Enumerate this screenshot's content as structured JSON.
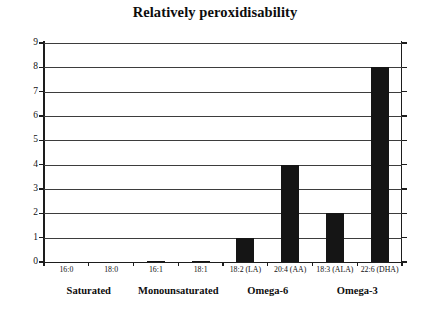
{
  "chart_data": {
    "type": "bar",
    "title": "Relatively peroxidisability",
    "xlabel": "",
    "ylabel": "",
    "ylim": [
      0,
      9
    ],
    "yticks": [
      0,
      1,
      2,
      3,
      4,
      5,
      6,
      7,
      8,
      9
    ],
    "grid": true,
    "legend": false,
    "categories": [
      "16:0",
      "18:0",
      "16:1",
      "18:1",
      "18:2 (LA)",
      "20:4 (AA)",
      "18:3 (ALA)",
      "22:6 (DHA)"
    ],
    "values": [
      0,
      0,
      0.025,
      0.025,
      1,
      4,
      2,
      8
    ],
    "groups": [
      {
        "label": "Saturated",
        "categories": [
          "16:0",
          "18:0"
        ]
      },
      {
        "label": "Monounsaturated",
        "categories": [
          "16:1",
          "18:1"
        ]
      },
      {
        "label": "Omega-6",
        "categories": [
          "18:2 (LA)",
          "20:4 (AA)"
        ]
      },
      {
        "label": "Omega-3",
        "categories": [
          "18:3 (ALA)",
          "22:6 (DHA)"
        ]
      }
    ],
    "bar_color": "#151515",
    "axis_color": "#1d1d1d",
    "grid_color": "#3d3d3d",
    "background_color": "#ffffff"
  }
}
